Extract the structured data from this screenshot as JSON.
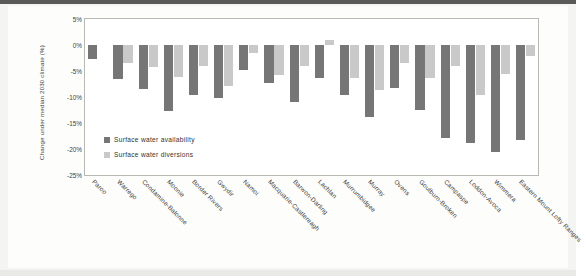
{
  "figure": {
    "ylabel": "Change under median 2030 climate (%)",
    "frame_color": "#b9b9b4",
    "plot_background": "#ffffff"
  },
  "legend": {
    "items": [
      {
        "label": "Surface water availability",
        "color": "#767676",
        "swatch_icon": "square-swatch-icon"
      },
      {
        "label": "Surface water diversions",
        "color": "#c9c9c9",
        "swatch_icon": "square-swatch-icon"
      }
    ]
  },
  "yaxis": {
    "ticks": [
      "5%",
      "0%",
      "-5%",
      "-10%",
      "-15%",
      "-20%",
      "-25%"
    ],
    "min": -25,
    "max": 5,
    "step": 5
  },
  "chart_data": {
    "type": "bar",
    "title": "",
    "xlabel": "",
    "ylabel": "Change under median 2030 climate (%)",
    "ylim": [
      -25,
      5
    ],
    "yticks": [
      5,
      0,
      -5,
      -10,
      -15,
      -20,
      -25
    ],
    "ytick_labels": [
      "5%",
      "0%",
      "-5%",
      "-10%",
      "-15%",
      "-20%",
      "-25%"
    ],
    "grid": false,
    "legend_position": "inside-lower-left",
    "categories": [
      "Paroo",
      "Warrego",
      "Condamine-Balonne",
      "Moonie",
      "Border Rivers",
      "Gwydir",
      "Namoi",
      "Macquarie-Castlereagh",
      "Barwon-Darling",
      "Lachlan",
      "Murrumbidgee",
      "Murray",
      "Ovens",
      "Goulburn-Broken",
      "Campaspe",
      "Loddon-Avoca",
      "Wimmera",
      "Eastern Mount Lofty Ranges"
    ],
    "series": [
      {
        "name": "Surface water availability",
        "color": "#767676",
        "values": [
          -2.6,
          -6.6,
          -8.4,
          -12.7,
          -9.6,
          -10.2,
          -4.8,
          -7.4,
          -10.9,
          -6.4,
          -9.7,
          -13.8,
          -8.2,
          -12.5,
          -17.9,
          -18.9,
          -20.6,
          -18.3
        ]
      },
      {
        "name": "Surface water diversions",
        "color": "#c9c9c9",
        "values": [
          null,
          -3.4,
          -4.2,
          -6.2,
          -4.1,
          -7.8,
          -1.6,
          -5.8,
          -4.0,
          1.0,
          -6.3,
          -8.7,
          -3.5,
          -6.4,
          -4.0,
          -9.7,
          -5.6,
          -2.1
        ]
      }
    ]
  }
}
